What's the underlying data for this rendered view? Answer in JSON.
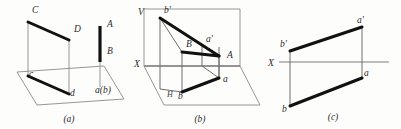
{
  "figure": {
    "background_color": "#fdfdfc",
    "line_color": "#111111",
    "thin_line_color": "#8a8a8a",
    "axis_color": "#7d7d7d"
  },
  "panels": [
    {
      "id": "a",
      "caption": "(a)",
      "description": "Pictorial view: line CD above H plane with its projection cd, and vertical line AB projecting to point a(b)",
      "labels": [
        {
          "name": "point-C",
          "text": "C",
          "x": 32,
          "y": 13
        },
        {
          "name": "point-D",
          "text": "D",
          "x": 74,
          "y": 32
        },
        {
          "name": "point-A",
          "text": "A",
          "x": 107,
          "y": 27
        },
        {
          "name": "point-B",
          "text": "B",
          "x": 107,
          "y": 54
        },
        {
          "name": "point-c",
          "text": "c",
          "x": 29,
          "y": 77
        },
        {
          "name": "point-d",
          "text": "d",
          "x": 70,
          "y": 96
        },
        {
          "name": "point-ab-coincident",
          "text": "a(b)",
          "x": 95,
          "y": 93
        }
      ]
    },
    {
      "id": "b",
      "caption": "(b)",
      "description": "Pictorial view of two-plane system: V frontal plane and H horizontal plane, line AB with front view a'b' and top view ab",
      "labels": [
        {
          "name": "plane-V",
          "text": "V",
          "x": 8,
          "y": 15
        },
        {
          "name": "point-b-prime",
          "text": "b'",
          "x": 34,
          "y": 13
        },
        {
          "name": "point-a-prime",
          "text": "a'",
          "x": 76,
          "y": 42
        },
        {
          "name": "point-B",
          "text": "B",
          "x": 56,
          "y": 47
        },
        {
          "name": "point-A",
          "text": "A",
          "x": 97,
          "y": 58
        },
        {
          "name": "axis-X",
          "text": "X",
          "x": 4,
          "y": 67
        },
        {
          "name": "point-a",
          "text": "a",
          "x": 93,
          "y": 82
        },
        {
          "name": "plane-H",
          "text": "H",
          "x": 37,
          "y": 97
        },
        {
          "name": "point-b",
          "text": "b",
          "x": 48,
          "y": 99
        }
      ]
    },
    {
      "id": "c",
      "caption": "(c)",
      "description": "Two-view orthographic drawing: front view a'b' above the X axis and top view ab below it",
      "labels": [
        {
          "name": "point-a-prime",
          "text": "a'",
          "x": 92,
          "y": 23
        },
        {
          "name": "point-b-prime",
          "text": "b'",
          "x": 18,
          "y": 47
        },
        {
          "name": "axis-X",
          "text": "X",
          "x": 4,
          "y": 66
        },
        {
          "name": "point-a",
          "text": "a",
          "x": 92,
          "y": 81
        },
        {
          "name": "point-b",
          "text": "b",
          "x": 21,
          "y": 110
        }
      ]
    }
  ],
  "captions": {
    "a": "(a)",
    "b": "(b)",
    "c": "(c)"
  }
}
